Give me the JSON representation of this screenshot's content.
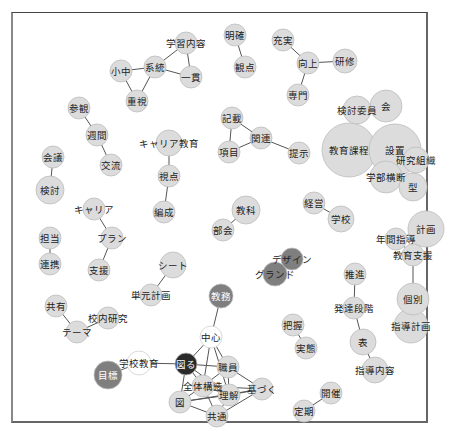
{
  "diagram": {
    "type": "co-occurrence-network",
    "colors": {
      "node_default": "#dcdcdc",
      "node_stroke": "#bdbdbd",
      "node_dark": "#2a2a2a",
      "node_mid": "#7f7f7f",
      "node_white": "#ffffff",
      "edge": "#555555",
      "label": "#222222",
      "label_on_dark": "#ffffff"
    },
    "nodes": [
      {
        "id": "gakushu_naiyo",
        "label": "学習内容",
        "x": 186,
        "y": 43,
        "r": 11,
        "fill": "default"
      },
      {
        "id": "keito",
        "label": "系統",
        "x": 155,
        "y": 67,
        "r": 11,
        "fill": "default"
      },
      {
        "id": "shochu",
        "label": "小中",
        "x": 121,
        "y": 71,
        "r": 11,
        "fill": "default"
      },
      {
        "id": "ikkan",
        "label": "一貫",
        "x": 191,
        "y": 77,
        "r": 11,
        "fill": "default"
      },
      {
        "id": "juushi",
        "label": "重視",
        "x": 137,
        "y": 101,
        "r": 11,
        "fill": "default"
      },
      {
        "id": "meikaku",
        "label": "明確",
        "x": 235,
        "y": 35,
        "r": 11,
        "fill": "default"
      },
      {
        "id": "kanten",
        "label": "観点",
        "x": 245,
        "y": 67,
        "r": 11,
        "fill": "default"
      },
      {
        "id": "jujitsu",
        "label": "充実",
        "x": 283,
        "y": 40,
        "r": 11,
        "fill": "default"
      },
      {
        "id": "kojo",
        "label": "向上",
        "x": 308,
        "y": 63,
        "r": 11,
        "fill": "default"
      },
      {
        "id": "kenshu",
        "label": "研修",
        "x": 345,
        "y": 61,
        "r": 12,
        "fill": "default"
      },
      {
        "id": "senmon",
        "label": "専門",
        "x": 298,
        "y": 95,
        "r": 11,
        "fill": "default"
      },
      {
        "id": "sankan",
        "label": "参観",
        "x": 79,
        "y": 108,
        "r": 11,
        "fill": "default"
      },
      {
        "id": "shukan",
        "label": "週間",
        "x": 97,
        "y": 135,
        "r": 11,
        "fill": "default"
      },
      {
        "id": "koryu",
        "label": "交流",
        "x": 111,
        "y": 165,
        "r": 11,
        "fill": "default"
      },
      {
        "id": "kaigi",
        "label": "会議",
        "x": 53,
        "y": 157,
        "r": 11,
        "fill": "default"
      },
      {
        "id": "kento",
        "label": "検討",
        "x": 50,
        "y": 190,
        "r": 14,
        "fill": "default"
      },
      {
        "id": "career_kyoiku",
        "label": "キャリア教育",
        "x": 169,
        "y": 143,
        "r": 13,
        "fill": "default"
      },
      {
        "id": "shiten",
        "label": "視点",
        "x": 169,
        "y": 176,
        "r": 11,
        "fill": "default"
      },
      {
        "id": "hensei",
        "label": "編成",
        "x": 164,
        "y": 212,
        "r": 11,
        "fill": "default"
      },
      {
        "id": "kisai",
        "label": "記載",
        "x": 232,
        "y": 118,
        "r": 11,
        "fill": "default"
      },
      {
        "id": "kanren",
        "label": "関連",
        "x": 261,
        "y": 138,
        "r": 11,
        "fill": "default"
      },
      {
        "id": "komoku",
        "label": "項目",
        "x": 229,
        "y": 152,
        "r": 11,
        "fill": "default"
      },
      {
        "id": "teiji",
        "label": "提示",
        "x": 299,
        "y": 153,
        "r": 11,
        "fill": "default"
      },
      {
        "id": "kento_iin",
        "label": "検討委員",
        "x": 357,
        "y": 110,
        "r": 14,
        "fill": "default"
      },
      {
        "id": "kai",
        "label": "会",
        "x": 386,
        "y": 106,
        "r": 16,
        "fill": "default"
      },
      {
        "id": "kyoiku_katei",
        "label": "教育課程",
        "x": 349,
        "y": 150,
        "r": 27,
        "fill": "default"
      },
      {
        "id": "setchi",
        "label": "設置",
        "x": 395,
        "y": 150,
        "r": 26,
        "fill": "default"
      },
      {
        "id": "kenkyu_soshiki",
        "label": "研究組織",
        "x": 416,
        "y": 160,
        "r": 13,
        "fill": "default"
      },
      {
        "id": "gakubu_odan",
        "label": "学部横断",
        "x": 386,
        "y": 177,
        "r": 16,
        "fill": "default"
      },
      {
        "id": "kata",
        "label": "型",
        "x": 413,
        "y": 187,
        "r": 14,
        "fill": "default"
      },
      {
        "id": "career",
        "label": "キャリア",
        "x": 94,
        "y": 209,
        "r": 11,
        "fill": "default"
      },
      {
        "id": "plan",
        "label": "プラン",
        "x": 112,
        "y": 238,
        "r": 11,
        "fill": "default"
      },
      {
        "id": "shien",
        "label": "支援",
        "x": 99,
        "y": 270,
        "r": 11,
        "fill": "default"
      },
      {
        "id": "tanto",
        "label": "担当",
        "x": 50,
        "y": 238,
        "r": 11,
        "fill": "default"
      },
      {
        "id": "renkei",
        "label": "連携",
        "x": 50,
        "y": 264,
        "r": 11,
        "fill": "default"
      },
      {
        "id": "kyoka",
        "label": "教科",
        "x": 246,
        "y": 210,
        "r": 14,
        "fill": "default"
      },
      {
        "id": "bukai",
        "label": "部会",
        "x": 223,
        "y": 230,
        "r": 11,
        "fill": "default"
      },
      {
        "id": "keiei",
        "label": "経営",
        "x": 314,
        "y": 203,
        "r": 11,
        "fill": "default"
      },
      {
        "id": "gakko",
        "label": "学校",
        "x": 341,
        "y": 219,
        "r": 13,
        "fill": "default"
      },
      {
        "id": "keikaku",
        "label": "計画",
        "x": 426,
        "y": 229,
        "r": 18,
        "fill": "default"
      },
      {
        "id": "nenkan_shido",
        "label": "年間指導",
        "x": 396,
        "y": 239,
        "r": 11,
        "fill": "default"
      },
      {
        "id": "kyoiku_shien",
        "label": "教育支援",
        "x": 413,
        "y": 255,
        "r": 11,
        "fill": "default"
      },
      {
        "id": "kobetsu",
        "label": "個別",
        "x": 413,
        "y": 299,
        "r": 16,
        "fill": "default"
      },
      {
        "id": "shido_keikaku",
        "label": "指導計画",
        "x": 411,
        "y": 326,
        "r": 17,
        "fill": "default"
      },
      {
        "id": "sheet",
        "label": "シート",
        "x": 173,
        "y": 265,
        "r": 13,
        "fill": "default"
      },
      {
        "id": "tangen_keikaku",
        "label": "単元計画",
        "x": 151,
        "y": 295,
        "r": 11,
        "fill": "default"
      },
      {
        "id": "design",
        "label": "デザイン",
        "x": 292,
        "y": 259,
        "r": 11,
        "fill": "mid"
      },
      {
        "id": "grand",
        "label": "グランド",
        "x": 275,
        "y": 274,
        "r": 12,
        "fill": "mid"
      },
      {
        "id": "suishin",
        "label": "推進",
        "x": 355,
        "y": 274,
        "r": 11,
        "fill": "default"
      },
      {
        "id": "hattatsu_dankai",
        "label": "発達段階",
        "x": 354,
        "y": 308,
        "r": 11,
        "fill": "default"
      },
      {
        "id": "hyo",
        "label": "表",
        "x": 363,
        "y": 342,
        "r": 13,
        "fill": "default"
      },
      {
        "id": "shido_naiyo",
        "label": "指導内容",
        "x": 375,
        "y": 370,
        "r": 13,
        "fill": "default"
      },
      {
        "id": "haaku",
        "label": "把握",
        "x": 293,
        "y": 325,
        "r": 11,
        "fill": "default"
      },
      {
        "id": "jittai",
        "label": "実態",
        "x": 306,
        "y": 348,
        "r": 11,
        "fill": "default"
      },
      {
        "id": "kaisai",
        "label": "開催",
        "x": 331,
        "y": 393,
        "r": 11,
        "fill": "default"
      },
      {
        "id": "teiki",
        "label": "定期",
        "x": 304,
        "y": 411,
        "r": 11,
        "fill": "default"
      },
      {
        "id": "kyoyu",
        "label": "共有",
        "x": 56,
        "y": 306,
        "r": 11,
        "fill": "default"
      },
      {
        "id": "konai_kenkyu",
        "label": "校内研究",
        "x": 108,
        "y": 318,
        "r": 11,
        "fill": "default"
      },
      {
        "id": "theme",
        "label": "テーマ",
        "x": 77,
        "y": 332,
        "r": 11,
        "fill": "default"
      },
      {
        "id": "kyomu",
        "label": "教務",
        "x": 221,
        "y": 296,
        "r": 12,
        "fill": "mid"
      },
      {
        "id": "chushin",
        "label": "中心",
        "x": 211,
        "y": 337,
        "r": 11,
        "fill": "white"
      },
      {
        "id": "gakko_kyoiku",
        "label": "学校教育",
        "x": 139,
        "y": 363,
        "r": 12,
        "fill": "white"
      },
      {
        "id": "mokuhyo",
        "label": "目標",
        "x": 108,
        "y": 375,
        "r": 14,
        "fill": "mid"
      },
      {
        "id": "hakaru",
        "label": "図る",
        "x": 186,
        "y": 364,
        "r": 11,
        "fill": "dark"
      },
      {
        "id": "shokuin",
        "label": "職員",
        "x": 228,
        "y": 367,
        "r": 11,
        "fill": "default"
      },
      {
        "id": "zentai_kozo",
        "label": "全体構造",
        "x": 203,
        "y": 386,
        "r": 11,
        "fill": "default"
      },
      {
        "id": "rikai",
        "label": "理解",
        "x": 229,
        "y": 395,
        "r": 11,
        "fill": "default"
      },
      {
        "id": "motozuku",
        "label": "基づく",
        "x": 262,
        "y": 389,
        "r": 11,
        "fill": "default"
      },
      {
        "id": "zu",
        "label": "図",
        "x": 180,
        "y": 402,
        "r": 11,
        "fill": "default"
      },
      {
        "id": "kyotsu",
        "label": "共通",
        "x": 217,
        "y": 416,
        "r": 11,
        "fill": "default"
      }
    ],
    "edges": [
      [
        "shochu",
        "keito"
      ],
      [
        "shochu",
        "juushi"
      ],
      [
        "keito",
        "juushi"
      ],
      [
        "keito",
        "gakushu_naiyo"
      ],
      [
        "keito",
        "ikkan"
      ],
      [
        "gakushu_naiyo",
        "ikkan"
      ],
      [
        "meikaku",
        "kanten"
      ],
      [
        "jujitsu",
        "kojo"
      ],
      [
        "kojo",
        "kenshu"
      ],
      [
        "kojo",
        "senmon"
      ],
      [
        "sankan",
        "shukan"
      ],
      [
        "shukan",
        "koryu"
      ],
      [
        "kaigi",
        "kento"
      ],
      [
        "career_kyoiku",
        "shiten"
      ],
      [
        "shiten",
        "hensei"
      ],
      [
        "kisai",
        "kanren"
      ],
      [
        "kisai",
        "komoku"
      ],
      [
        "komoku",
        "kanren"
      ],
      [
        "kanren",
        "teiji"
      ],
      [
        "kento_iin",
        "kai"
      ],
      [
        "kenkyu_soshiki",
        "gakubu_odan"
      ],
      [
        "career",
        "plan"
      ],
      [
        "plan",
        "shien"
      ],
      [
        "tanto",
        "renkei"
      ],
      [
        "kyoka",
        "bukai"
      ],
      [
        "keiei",
        "gakko"
      ],
      [
        "keikaku",
        "nenkan_shido"
      ],
      [
        "nenkan_shido",
        "kyoiku_shien"
      ],
      [
        "kyoiku_shien",
        "kobetsu"
      ],
      [
        "kobetsu",
        "shido_keikaku"
      ],
      [
        "sheet",
        "tangen_keikaku"
      ],
      [
        "design",
        "grand"
      ],
      [
        "suishin",
        "hattatsu_dankai"
      ],
      [
        "hattatsu_dankai",
        "hyo"
      ],
      [
        "hyo",
        "shido_naiyo"
      ],
      [
        "haaku",
        "jittai"
      ],
      [
        "kaisai",
        "teiki"
      ],
      [
        "kyoyu",
        "theme"
      ],
      [
        "theme",
        "konai_kenkyu"
      ],
      [
        "kyomu",
        "chushin"
      ],
      [
        "mokuhyo",
        "gakko_kyoiku"
      ],
      [
        "gakko_kyoiku",
        "hakaru"
      ],
      [
        "hakaru",
        "chushin"
      ],
      [
        "hakaru",
        "shokuin"
      ],
      [
        "hakaru",
        "zentai_kozo"
      ],
      [
        "hakaru",
        "zu"
      ],
      [
        "hakaru",
        "rikai"
      ],
      [
        "chushin",
        "shokuin"
      ],
      [
        "chushin",
        "zentai_kozo"
      ],
      [
        "chushin",
        "rikai"
      ],
      [
        "shokuin",
        "zentai_kozo"
      ],
      [
        "shokuin",
        "rikai"
      ],
      [
        "shokuin",
        "motozuku"
      ],
      [
        "zentai_kozo",
        "zu"
      ],
      [
        "zentai_kozo",
        "rikai"
      ],
      [
        "zentai_kozo",
        "kyotsu"
      ],
      [
        "zentai_kozo",
        "motozuku"
      ],
      [
        "zu",
        "rikai"
      ],
      [
        "zu",
        "kyotsu"
      ],
      [
        "zu",
        "motozuku"
      ],
      [
        "rikai",
        "motozuku"
      ],
      [
        "rikai",
        "kyotsu"
      ],
      [
        "kyotsu",
        "motozuku"
      ]
    ]
  }
}
